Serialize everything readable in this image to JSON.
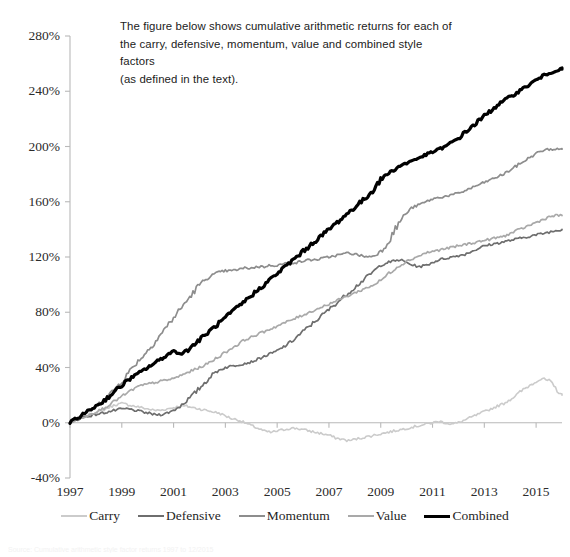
{
  "caption": {
    "text": "The figure below shows cumulative arithmetic returns for each of\nthe carry, defensive, momentum, value and combined style factors\n(as defined in the text)."
  },
  "footnote": {
    "text": "Source: Cumulative arithmetic style factor returns 1997 to 12/2015"
  },
  "colors": {
    "carry": "#cbcbcb",
    "defensive": "#6e6e6e",
    "momentum": "#8d8d8d",
    "value": "#a9a9a9",
    "combined": "#000000",
    "axis": "#b9b9b9",
    "text": "#2b2b2b",
    "background": "#ffffff"
  },
  "chart_data": {
    "type": "line",
    "title": "",
    "xlabel": "",
    "ylabel": "",
    "xlim": [
      1997,
      2016
    ],
    "ylim": [
      -40,
      280
    ],
    "grid": false,
    "legend_position": "bottom",
    "y_ticks": [
      "280%",
      "240%",
      "200%",
      "160%",
      "120%",
      "80%",
      "40%",
      "0%",
      "-40%"
    ],
    "y_tick_values": [
      280,
      240,
      200,
      160,
      120,
      80,
      40,
      0,
      -40
    ],
    "x_ticks": [
      "1997",
      "1999",
      "2001",
      "2003",
      "2005",
      "2007",
      "2009",
      "2011",
      "2013",
      "2015"
    ],
    "x_tick_values": [
      1997,
      1999,
      2001,
      2003,
      2005,
      2007,
      2009,
      2011,
      2013,
      2015
    ],
    "x": [
      1997.0,
      1997.25,
      1997.5,
      1997.75,
      1998.0,
      1998.25,
      1998.5,
      1998.75,
      1999.0,
      1999.25,
      1999.5,
      1999.75,
      2000.0,
      2000.25,
      2000.5,
      2000.75,
      2001.0,
      2001.25,
      2001.5,
      2001.75,
      2002.0,
      2002.25,
      2002.5,
      2002.75,
      2003.0,
      2003.25,
      2003.5,
      2003.75,
      2004.0,
      2004.25,
      2004.5,
      2004.75,
      2005.0,
      2005.25,
      2005.5,
      2005.75,
      2006.0,
      2006.25,
      2006.5,
      2006.75,
      2007.0,
      2007.25,
      2007.5,
      2007.75,
      2008.0,
      2008.25,
      2008.5,
      2008.75,
      2009.0,
      2009.25,
      2009.5,
      2009.75,
      2010.0,
      2010.25,
      2010.5,
      2010.75,
      2011.0,
      2011.25,
      2011.5,
      2011.75,
      2012.0,
      2012.25,
      2012.5,
      2012.75,
      2013.0,
      2013.25,
      2013.5,
      2013.75,
      2014.0,
      2014.25,
      2014.5,
      2014.75,
      2015.0,
      2015.25,
      2015.5,
      2015.75,
      2016.0
    ],
    "series": [
      {
        "name": "Carry",
        "color": "#cbcbcb",
        "width": 1.6,
        "final_value": 20,
        "values": [
          0,
          2,
          4,
          6,
          7,
          9,
          11,
          13,
          14,
          13,
          12,
          11,
          10,
          9,
          9,
          10,
          11,
          12,
          12,
          11,
          10,
          9,
          8,
          7,
          5,
          3,
          2,
          0,
          -2,
          -4,
          -6,
          -7,
          -6,
          -5,
          -4,
          -4,
          -5,
          -6,
          -7,
          -8,
          -9,
          -11,
          -12,
          -13,
          -12,
          -11,
          -10,
          -9,
          -8,
          -7,
          -6,
          -5,
          -4,
          -3,
          -2,
          -1,
          0,
          1,
          0,
          -1,
          0,
          2,
          4,
          6,
          8,
          10,
          12,
          14,
          17,
          20,
          24,
          27,
          30,
          32,
          30,
          25,
          20
        ]
      },
      {
        "name": "Defensive",
        "color": "#6e6e6e",
        "width": 1.7,
        "final_value": 140,
        "values": [
          0,
          2,
          4,
          5,
          6,
          7,
          8,
          9,
          10,
          10,
          9,
          8,
          7,
          6,
          6,
          7,
          9,
          12,
          16,
          20,
          25,
          30,
          35,
          38,
          40,
          41,
          42,
          43,
          44,
          46,
          48,
          50,
          52,
          55,
          58,
          62,
          66,
          70,
          74,
          78,
          82,
          86,
          90,
          94,
          98,
          102,
          106,
          110,
          114,
          116,
          117,
          118,
          116,
          114,
          113,
          114,
          116,
          118,
          119,
          120,
          121,
          122,
          124,
          126,
          128,
          129,
          130,
          131,
          132,
          133,
          134,
          135,
          136,
          137,
          138,
          139,
          140
        ]
      },
      {
        "name": "Momentum",
        "color": "#8d8d8d",
        "width": 1.7,
        "final_value": 198,
        "values": [
          0,
          3,
          6,
          9,
          12,
          16,
          20,
          25,
          30,
          36,
          42,
          47,
          52,
          58,
          64,
          70,
          76,
          82,
          88,
          94,
          100,
          104,
          107,
          109,
          110,
          110,
          111,
          112,
          112,
          113,
          113,
          114,
          114,
          115,
          116,
          116,
          117,
          118,
          118,
          119,
          120,
          121,
          122,
          123,
          122,
          121,
          120,
          121,
          124,
          130,
          138,
          146,
          152,
          156,
          158,
          160,
          162,
          163,
          164,
          165,
          166,
          168,
          170,
          172,
          174,
          176,
          178,
          180,
          183,
          186,
          189,
          192,
          195,
          197,
          198,
          198,
          198
        ]
      },
      {
        "name": "Value",
        "color": "#a9a9a9",
        "width": 1.7,
        "final_value": 150,
        "values": [
          0,
          2,
          4,
          6,
          8,
          10,
          13,
          16,
          19,
          22,
          25,
          27,
          28,
          29,
          30,
          31,
          32,
          34,
          36,
          38,
          40,
          42,
          45,
          48,
          51,
          54,
          57,
          60,
          62,
          64,
          66,
          68,
          70,
          72,
          74,
          76,
          78,
          80,
          82,
          84,
          86,
          88,
          90,
          92,
          94,
          96,
          98,
          100,
          103,
          107,
          111,
          114,
          117,
          119,
          121,
          123,
          124,
          125,
          126,
          127,
          128,
          129,
          130,
          131,
          132,
          133,
          134,
          135,
          137,
          139,
          141,
          143,
          145,
          147,
          149,
          150,
          150
        ]
      },
      {
        "name": "Combined",
        "color": "#000000",
        "width": 3.2,
        "final_value": 256,
        "values": [
          0,
          3,
          6,
          9,
          12,
          15,
          19,
          23,
          27,
          31,
          34,
          37,
          40,
          43,
          46,
          49,
          52,
          50,
          52,
          56,
          60,
          64,
          68,
          72,
          76,
          80,
          84,
          88,
          92,
          96,
          100,
          104,
          108,
          112,
          116,
          120,
          124,
          128,
          132,
          136,
          140,
          144,
          148,
          152,
          156,
          160,
          164,
          170,
          176,
          180,
          183,
          186,
          188,
          190,
          192,
          194,
          196,
          198,
          200,
          203,
          206,
          210,
          214,
          218,
          222,
          226,
          230,
          233,
          236,
          239,
          242,
          245,
          248,
          251,
          253,
          255,
          256
        ]
      }
    ]
  }
}
